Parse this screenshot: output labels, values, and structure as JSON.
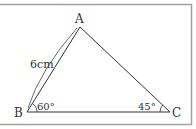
{
  "figure": {
    "type": "triangle",
    "vertices": {
      "A": {
        "label": "A",
        "x": 80,
        "y": 27
      },
      "B": {
        "label": "B",
        "x": 27,
        "y": 112
      },
      "C": {
        "label": "C",
        "x": 170,
        "y": 112
      }
    },
    "side_label": "6cm",
    "angles": {
      "B": "60°",
      "C": "45°"
    },
    "colors": {
      "line": "#333333",
      "border": "#999999",
      "background": "#ffffff"
    }
  }
}
